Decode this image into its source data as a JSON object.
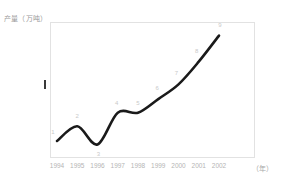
{
  "chart_data": {
    "type": "line",
    "title": "",
    "ylabel": "产量（万吨）",
    "xlabel": "（年）",
    "grid": false,
    "legend": "none",
    "ylim": [
      40,
      160
    ],
    "yticks": [
      150,
      130,
      110,
      90,
      70,
      50
    ],
    "ytick_labels": [
      "150",
      "130",
      "110",
      "90",
      "70",
      "50"
    ],
    "categories": [
      "1994",
      "1995",
      "1996",
      "1997",
      "1998",
      "1999",
      "2000",
      "2001",
      "2002"
    ],
    "x": [
      1994,
      1995,
      1996,
      1997,
      1998,
      1999,
      2000,
      2001,
      2002
    ],
    "values": [
      55,
      68,
      52,
      80,
      80,
      92,
      105,
      125,
      148
    ],
    "point_labels": [
      "1",
      "2",
      "3",
      "4",
      "5",
      "6",
      "7",
      "8",
      "9"
    ],
    "series": [
      {
        "name": "产量",
        "values": [
          55,
          68,
          52,
          80,
          80,
          92,
          105,
          125,
          148
        ]
      }
    ]
  },
  "axes": {
    "y_title": "产量（万吨）",
    "x_unit": "（年）",
    "y_ticks": [
      {
        "label": "150",
        "value": 150
      },
      {
        "label": "130",
        "value": 130
      },
      {
        "label": "110",
        "value": 110
      },
      {
        "label": "90",
        "value": 90
      },
      {
        "label": "70",
        "value": 70
      },
      {
        "label": "50",
        "value": 50
      }
    ],
    "x_ticks": [
      {
        "label": "1994"
      },
      {
        "label": "1995"
      },
      {
        "label": "1996"
      },
      {
        "label": "1997"
      },
      {
        "label": "1998"
      },
      {
        "label": "1999"
      },
      {
        "label": "2000"
      },
      {
        "label": "2001"
      },
      {
        "label": "2002"
      }
    ]
  },
  "style": {
    "curve_color": "#1a1a1a",
    "frame_color": "#e2e2e2",
    "tick_text_color": "#b0b0b0",
    "title_color": "#9a9a9a",
    "point_label_color": "#c9c9c9",
    "background": "#ffffff"
  }
}
